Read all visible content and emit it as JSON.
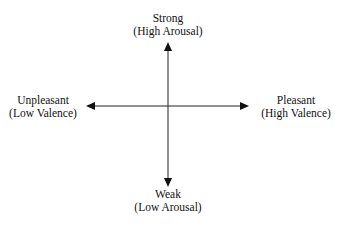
{
  "diagram": {
    "type": "two-axis emotion space",
    "axes": {
      "vertical": {
        "top": {
          "label": "Strong",
          "sublabel": "(High Arousal)"
        },
        "bottom": {
          "label": "Weak",
          "sublabel": "(Low Arousal)"
        }
      },
      "horizontal": {
        "left": {
          "label": "Unpleasant",
          "sublabel": "(Low Valence)"
        },
        "right": {
          "label": "Pleasant",
          "sublabel": "(High Valence)"
        }
      }
    },
    "colors": {
      "line": "#222222",
      "text": "#111111",
      "background": "#ffffff"
    }
  }
}
